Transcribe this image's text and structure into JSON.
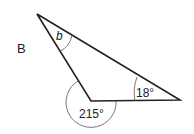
{
  "diagram": {
    "label": "B",
    "angles": {
      "top": "b",
      "right": "18°",
      "reflex": "215°"
    },
    "colors": {
      "stroke": "#222222",
      "arc": "#555555",
      "text": "#222222"
    }
  }
}
